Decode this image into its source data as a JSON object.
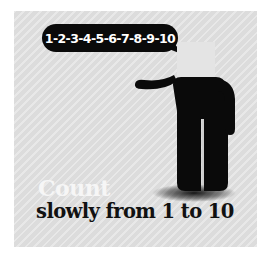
{
  "speech_bubble": {
    "text": "1-2-3-4-5-6-7-8-9-10"
  },
  "caption": {
    "headline": "Count",
    "subline": "slowly from 1 to 10"
  },
  "colors": {
    "background": "#dcdcdc",
    "figure": "#0a0a0a",
    "headline": "#f6f6f6",
    "subline": "#111111"
  },
  "icons": {
    "figure": "standing-person-icon",
    "bubble": "speech-bubble-icon"
  }
}
